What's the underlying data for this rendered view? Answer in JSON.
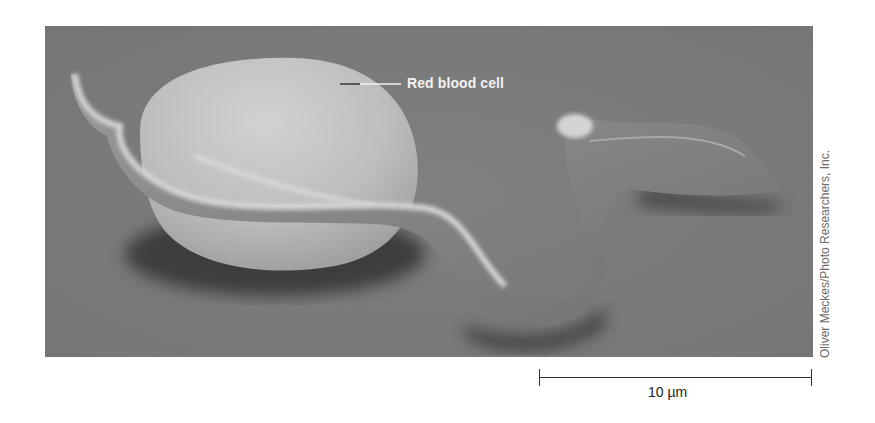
{
  "figure": {
    "annotation": {
      "label": "Red blood cell"
    },
    "credit": "Oliver Meckes/Photo Researchers, Inc.",
    "scale_bar": {
      "label": "10 µm",
      "value": 10,
      "unit": "µm"
    },
    "colors": {
      "background": "#7b7b7b",
      "cell_highlight": "#d8d8d8",
      "shadow": "#3a3a3a",
      "label_text": "#f2f2f2"
    }
  }
}
